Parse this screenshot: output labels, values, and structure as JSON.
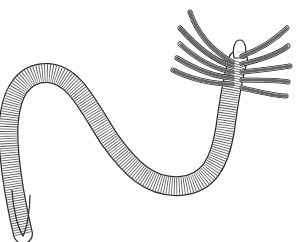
{
  "image": {
    "subject": "segmented worm illustration",
    "style": "black ink line drawing on white",
    "width": 298,
    "height": 242
  },
  "colors": {
    "background": "#ffffff",
    "ink": "#2a2a2a",
    "ink_light": "#6a6a6a"
  },
  "parts": {
    "body": "segmented body, S-curve",
    "head": "rounded head lobe",
    "tentacles_count": 10,
    "tail": "tapering tail"
  }
}
